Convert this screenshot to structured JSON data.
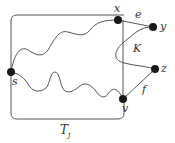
{
  "diagram": {
    "region_label": "T",
    "region_subscript": "j",
    "nodes": [
      {
        "id": "s",
        "label": "s"
      },
      {
        "id": "x",
        "label": "x"
      },
      {
        "id": "y",
        "label": "y"
      },
      {
        "id": "z",
        "label": "z"
      },
      {
        "id": "v",
        "label": "v"
      }
    ],
    "edges": [
      {
        "id": "e",
        "label": "e",
        "from": "x",
        "to": "y"
      },
      {
        "id": "f",
        "label": "f",
        "from": "v",
        "to": "z"
      }
    ],
    "path_label": "K",
    "colors": {
      "stroke": "#555555",
      "node": "#1a1a1a",
      "text": "#333333"
    }
  }
}
